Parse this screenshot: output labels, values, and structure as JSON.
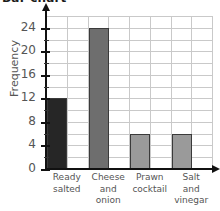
{
  "chart_data": {
    "type": "bar",
    "title": "Bar chart",
    "xlabel": "",
    "ylabel": "Frequency",
    "categories": [
      "Ready salted",
      "Cheese and onion",
      "Prawn cocktail",
      "Salt and vinegar"
    ],
    "category_lines": [
      [
        "Ready",
        "salted"
      ],
      [
        "Cheese",
        "and",
        "onion"
      ],
      [
        "Prawn",
        "cocktail"
      ],
      [
        "Salt",
        "and",
        "vinegar"
      ]
    ],
    "values": [
      12,
      24,
      6,
      6
    ],
    "bar_colors": [
      "#262626",
      "#6e6e6e",
      "#9a9a9a",
      "#9a9a9a"
    ],
    "ylim": [
      0,
      26
    ],
    "ytick_labels": [
      "0",
      "4",
      "8",
      "12",
      "16",
      "20",
      "24"
    ],
    "ytick_values": [
      0,
      4,
      8,
      12,
      16,
      20,
      24
    ],
    "minor_tick_values": [
      2,
      6,
      10,
      14,
      18,
      22
    ],
    "gridline_interval": 2,
    "grid": true,
    "legend": "none",
    "axis_arrows": true
  }
}
